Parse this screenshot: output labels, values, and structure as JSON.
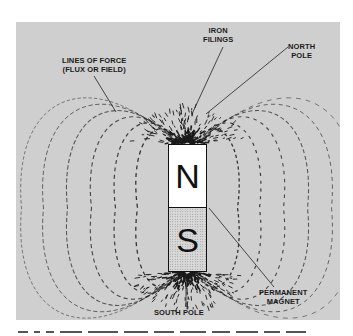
{
  "figure": {
    "magnet": {
      "north_letter": "N",
      "south_letter": "S"
    },
    "labels": {
      "iron_filings": [
        "IRON",
        "FILINGS"
      ],
      "north_pole": [
        "NORTH",
        "POLE"
      ],
      "lines_of_force": [
        "LINES OF FORCE",
        "(FLUX OR FIELD)"
      ],
      "permanent_magnet": [
        "PERMANENT",
        "MAGNET"
      ],
      "south_pole": [
        "SOUTH POLE"
      ]
    },
    "colors": {
      "background": "#cfcfcf",
      "ink": "#1a1a1a",
      "north_fill": "#ffffff",
      "south_fill": "#d8d8d8"
    }
  }
}
